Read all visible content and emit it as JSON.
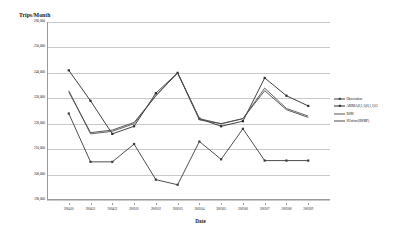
{
  "chart_data": {
    "type": "line",
    "title": "",
    "ylabel": "Trips/Month",
    "xlabel": "Date",
    "ylim": [
      190000,
      260000
    ],
    "ytick_values": [
      260000,
      250000,
      240000,
      230000,
      220000,
      210000,
      200000,
      190000
    ],
    "ytick_labels": [
      "260,000",
      "250,000",
      "240,000",
      "230,000",
      "220,000",
      "210,000",
      "200,000",
      "190,000"
    ],
    "grid": true,
    "legend_position": "right",
    "x": [
      "200410",
      "200411",
      "200412",
      "200501",
      "200502",
      "200503",
      "200504",
      "200505",
      "200506",
      "200507",
      "200508",
      "200509"
    ],
    "categories": [
      "200410",
      "200411",
      "200412",
      "200501",
      "200502",
      "200503",
      "200504",
      "200505",
      "200506",
      "200507",
      "200508",
      "200509"
    ],
    "series": [
      {
        "name": "Observation",
        "color": "#3a3a3a",
        "marker": "square",
        "values": [
          224000,
          205000,
          205000,
          212000,
          198000,
          196000,
          213000,
          206000,
          218000,
          205500,
          205500,
          205500
        ]
      },
      {
        "name": "ARIMA(0,1,1)(0,1,1)12",
        "color": "#2b2b2b",
        "marker": "square",
        "values": [
          241000,
          229000,
          216000,
          219000,
          232000,
          240000,
          222000,
          219000,
          221000,
          238000,
          231000,
          227000
        ]
      },
      {
        "name": "BSM",
        "color": "#555555",
        "marker": "none",
        "values": [
          233000,
          216000,
          217000,
          220000,
          231000,
          240000,
          222000,
          220000,
          222000,
          234000,
          226000,
          223000
        ]
      },
      {
        "name": "SUnivar/(BSMP)",
        "color": "#4a4a4a",
        "marker": "none",
        "values": [
          232500,
          216500,
          217500,
          220500,
          231000,
          240000,
          221500,
          220000,
          222000,
          233000,
          225500,
          222500
        ]
      }
    ]
  },
  "legend": {
    "entries": [
      {
        "label": "Observation"
      },
      {
        "label": "ARIMA(0,1,1)(0,1,1)12"
      },
      {
        "label": "BSM"
      },
      {
        "label": "SUnivar/(BSMP)"
      }
    ]
  }
}
